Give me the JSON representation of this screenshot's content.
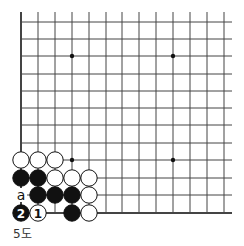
{
  "diagram": {
    "type": "go-board-diagram",
    "caption": "5도",
    "grid": {
      "columns_x": [
        21,
        38,
        55,
        72,
        89,
        106,
        122,
        139,
        156,
        173,
        190,
        207,
        224
      ],
      "rows_y": [
        22,
        39,
        56,
        74,
        91,
        108,
        125,
        143,
        160,
        178,
        195,
        213
      ],
      "top_y": 12,
      "right_x": 232,
      "left_edge": true,
      "bottom_edge": true
    },
    "star_points": [
      {
        "col": 3,
        "row": 2
      },
      {
        "col": 9,
        "row": 2
      },
      {
        "col": 3,
        "row": 8
      },
      {
        "col": 9,
        "row": 8
      }
    ],
    "stones": [
      {
        "color": "white",
        "col": 0,
        "row": 8
      },
      {
        "color": "white",
        "col": 1,
        "row": 8
      },
      {
        "color": "white",
        "col": 2,
        "row": 8
      },
      {
        "color": "black",
        "col": 0,
        "row": 9
      },
      {
        "color": "black",
        "col": 1,
        "row": 9
      },
      {
        "color": "white",
        "col": 2,
        "row": 9
      },
      {
        "color": "white",
        "col": 3,
        "row": 9
      },
      {
        "color": "white",
        "col": 4,
        "row": 9
      },
      {
        "color": "black",
        "col": 1,
        "row": 10
      },
      {
        "color": "black",
        "col": 2,
        "row": 10
      },
      {
        "color": "black",
        "col": 3,
        "row": 10
      },
      {
        "color": "white",
        "col": 4,
        "row": 10
      },
      {
        "color": "black",
        "col": 0,
        "row": 11,
        "label": "2"
      },
      {
        "color": "white",
        "col": 1,
        "row": 11,
        "label": "1"
      },
      {
        "color": "black",
        "col": 3,
        "row": 11
      },
      {
        "color": "white",
        "col": 4,
        "row": 11
      }
    ],
    "marks": [
      {
        "col": 0,
        "row": 10,
        "label": "a"
      }
    ]
  }
}
